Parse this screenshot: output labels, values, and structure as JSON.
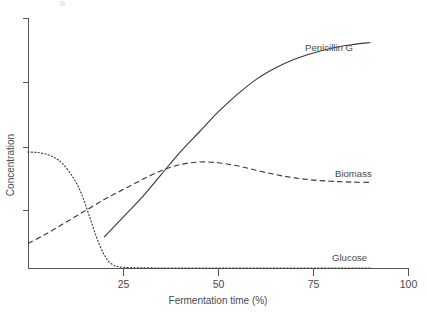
{
  "figure": {
    "background_color": "#ffffff",
    "line_color": "#3a3a3a",
    "axis_color": "#555555",
    "text_color": "#4a4a4a"
  },
  "axes": {
    "x_title": "Fermentation time (%)",
    "y_title": "Concentration",
    "x_tick_labels": [
      "25",
      "50",
      "75",
      "100"
    ],
    "y_tick_labels": [
      "",
      "",
      "",
      ""
    ]
  },
  "series_labels": {
    "penicillin": "Penicillin G",
    "biomass": "Biomass",
    "glucose": "Glucose"
  },
  "chart_data": {
    "type": "line",
    "title": "",
    "subtitle": "",
    "xlabel": "Fermentation time (%)",
    "ylabel": "Concentration",
    "xlim": [
      0,
      100
    ],
    "ylim": [
      0,
      1
    ],
    "xticks": [
      25,
      50,
      75,
      100
    ],
    "xtick_labels": [
      "25",
      "50",
      "75",
      "100"
    ],
    "yticks": [
      0.24,
      0.47,
      0.72,
      1.0
    ],
    "ytick_labels": [
      "",
      "",
      "",
      ""
    ],
    "grid": false,
    "legend": "inline-annotations",
    "legend_position": "right-of-curves",
    "annotations": [
      {
        "text": "Penicillin G",
        "x": 76,
        "y": 0.86
      },
      {
        "text": "Biomass",
        "x": 87,
        "y": 0.42
      },
      {
        "text": "Glucose",
        "x": 86,
        "y": 0.1
      }
    ],
    "series": [
      {
        "name": "Penicillin G",
        "style": "solid",
        "color": "#3a3a3a",
        "x": [
          20,
          25,
          30,
          35,
          40,
          45,
          50,
          55,
          60,
          65,
          70,
          75,
          80,
          85,
          90
        ],
        "values": [
          0.125,
          0.205,
          0.285,
          0.375,
          0.465,
          0.545,
          0.625,
          0.695,
          0.755,
          0.8,
          0.835,
          0.86,
          0.88,
          0.893,
          0.902
        ]
      },
      {
        "name": "Biomass",
        "style": "dashed",
        "color": "#3a3a3a",
        "x": [
          0,
          5,
          10,
          15,
          20,
          25,
          30,
          35,
          40,
          45,
          50,
          55,
          60,
          65,
          70,
          75,
          80,
          85,
          90
        ],
        "values": [
          0.1,
          0.14,
          0.185,
          0.23,
          0.275,
          0.315,
          0.355,
          0.39,
          0.415,
          0.425,
          0.422,
          0.41,
          0.392,
          0.375,
          0.362,
          0.353,
          0.348,
          0.345,
          0.344
        ]
      },
      {
        "name": "Glucose",
        "style": "dotted",
        "color": "#3a3a3a",
        "x": [
          0,
          3,
          6,
          9,
          12,
          14,
          16,
          18,
          20,
          22,
          25,
          35,
          50,
          65,
          80,
          90
        ],
        "values": [
          0.465,
          0.462,
          0.45,
          0.42,
          0.36,
          0.3,
          0.215,
          0.125,
          0.055,
          0.018,
          0.005,
          0.002,
          0.002,
          0.002,
          0.002,
          0.002
        ]
      }
    ]
  }
}
